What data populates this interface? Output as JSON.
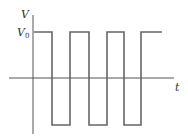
{
  "diagram": {
    "y_axis_label": "V",
    "x_axis_label": "t",
    "level_label": "V",
    "level_subscript": "0",
    "colors": {
      "axis": "#555555",
      "wave": "#666666",
      "text": "#333333",
      "background": "#ffffff"
    },
    "waveform": {
      "type": "square",
      "high": "V0",
      "low": "-V0",
      "cycles_shown": 3.5
    }
  }
}
